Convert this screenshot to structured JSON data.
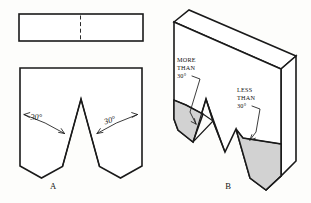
{
  "figure": {
    "background_color": "#fdfdfb",
    "line_color": "#1a1a1a",
    "shade_color": "#d2d2d2"
  },
  "view_a": {
    "label": "A",
    "description": "Orthographic top view and front view of V-block",
    "angle_left": "30°",
    "angle_right": "30°"
  },
  "view_b": {
    "label": "B",
    "description": "Isometric pictorial of V-block with two unequal grooves",
    "callout_left_line1": "MORE",
    "callout_left_line2": "THAN",
    "callout_left_line3": "30°",
    "callout_right_line1": "LESS",
    "callout_right_line2": "THAN",
    "callout_right_line3": "30°"
  }
}
